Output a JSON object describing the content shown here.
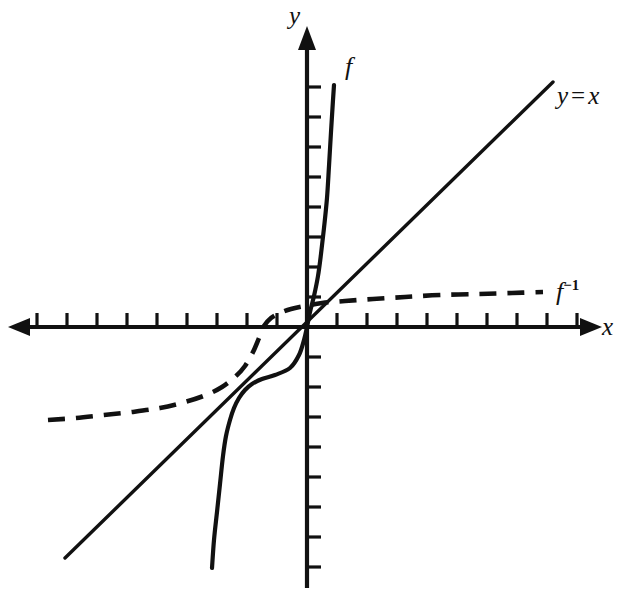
{
  "figure": {
    "kind": "cartesian-graph",
    "background_color": "#ffffff",
    "ink_color": "#111111",
    "width": 620,
    "height": 594
  },
  "labels": {
    "y_axis": "y",
    "x_axis": "x",
    "f_curve": "f",
    "identity_line_y": "y",
    "identity_line_eq": "=",
    "identity_line_x": "x",
    "inverse_curve_base": "f",
    "inverse_curve_exponent": "−1"
  },
  "chart_data": {
    "type": "line",
    "title": "",
    "xlabel": "x",
    "ylabel": "y",
    "grid": false,
    "legend": "inline-curve-labels",
    "axes": {
      "origin_px": [
        307,
        327
      ],
      "unit_px": 30,
      "x_axis_y_px": 327,
      "y_axis_x_px": 307,
      "xlim": [
        -9.9,
        9.4
      ],
      "ylim": [
        -8.6,
        9.9
      ],
      "x_tick_values": [
        -9,
        -8,
        -7,
        -6,
        -5,
        -4,
        -3,
        -2,
        -1,
        1,
        2,
        3,
        4,
        5,
        6,
        7,
        8,
        9
      ],
      "y_tick_values": [
        -8,
        -7,
        -6,
        -5,
        -4,
        -3,
        -2,
        -1,
        1,
        2,
        3,
        4,
        5,
        6,
        7,
        8
      ],
      "tick_length_px": 14,
      "x_tick_direction": "up",
      "y_tick_direction": "right",
      "arrows": [
        "x-left",
        "x-right",
        "y-up"
      ]
    },
    "series": [
      {
        "name": "f",
        "style": "solid",
        "label": "f",
        "label_px": [
          348,
          68
        ],
        "description": "increasing S-shaped (cubic-like) curve through the origin",
        "points_px": [
          [
            212,
            568
          ],
          [
            214,
            540
          ],
          [
            217,
            512
          ],
          [
            220,
            484
          ],
          [
            223,
            456
          ],
          [
            226,
            436
          ],
          [
            230,
            420
          ],
          [
            234,
            408
          ],
          [
            239,
            398
          ],
          [
            245,
            390
          ],
          [
            252,
            384
          ],
          [
            262,
            379
          ],
          [
            275,
            375
          ],
          [
            290,
            368
          ],
          [
            299,
            355
          ],
          [
            304,
            340
          ],
          [
            307,
            327
          ],
          [
            310,
            312
          ],
          [
            314,
            296
          ],
          [
            318,
            276
          ],
          [
            321,
            254
          ],
          [
            324,
            228
          ],
          [
            327,
            198
          ],
          [
            329,
            166
          ],
          [
            331,
            132
          ],
          [
            333,
            100
          ],
          [
            334,
            85
          ]
        ]
      },
      {
        "name": "y = x",
        "style": "solid",
        "label": "y = x",
        "label_px": [
          580,
          95
        ],
        "description": "identity line of slope 1 through the origin",
        "endpoints_px": [
          [
            65,
            558
          ],
          [
            553,
            82
          ]
        ]
      },
      {
        "name": "f-inverse",
        "style": "dashed",
        "label": "f⁻¹",
        "label_px": [
          575,
          292
        ],
        "description": "reflection of f across the line y = x",
        "points_px": [
          [
            48,
            420
          ],
          [
            76,
            418
          ],
          [
            104,
            415
          ],
          [
            132,
            412
          ],
          [
            160,
            408
          ],
          [
            185,
            402
          ],
          [
            206,
            395
          ],
          [
            222,
            387
          ],
          [
            235,
            377
          ],
          [
            245,
            366
          ],
          [
            253,
            352
          ],
          [
            259,
            338
          ],
          [
            264,
            326
          ],
          [
            271,
            318
          ],
          [
            280,
            313
          ],
          [
            291,
            309
          ],
          [
            305,
            306
          ],
          [
            322,
            303
          ],
          [
            345,
            301
          ],
          [
            373,
            299
          ],
          [
            405,
            297
          ],
          [
            440,
            295
          ],
          [
            478,
            294
          ],
          [
            512,
            293
          ],
          [
            543,
            292
          ]
        ]
      }
    ],
    "intersections_px": [
      [
        307,
        327
      ],
      [
        237,
        398
      ],
      [
        378,
        255
      ]
    ]
  }
}
